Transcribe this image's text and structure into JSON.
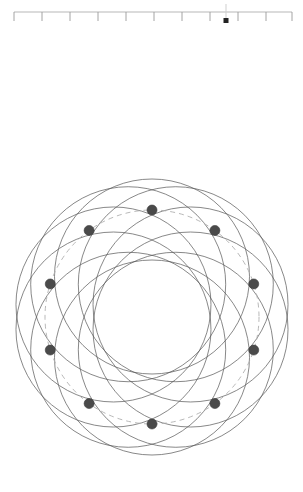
{
  "app": {
    "title": "Spirograph Rosette Viewer",
    "background_color": "#ffffff"
  },
  "ruler": {
    "name": "horizontal-ruler-slider",
    "orientation": "horizontal",
    "x_start": 14,
    "x_end": 292,
    "baseline_y": 12,
    "track_color": "#b8b8b8",
    "tick_color": "#9a9a9a",
    "major_tick_length": 9,
    "major_ticks": [
      14,
      42,
      70,
      98,
      126,
      154,
      182,
      210,
      238,
      266,
      292
    ],
    "tick_labels": [
      "",
      "",
      "",
      "",
      "",
      "",
      "",
      "",
      "",
      "",
      ""
    ],
    "handle": {
      "name": "ruler-handle",
      "position_x": 226,
      "stem_top_y": 4,
      "stem_bottom_y": 18,
      "marker_size": 5,
      "color": "#222222",
      "value_label": ""
    }
  },
  "figure": {
    "name": "rosette-diagram",
    "center_x": 152,
    "center_y": 287,
    "circle_count": 10,
    "circle_radius": 97.5,
    "center_offset_radius": 40.5,
    "stroke_color": "#555555",
    "stroke_width": 0.7,
    "outer_extent_radius": 138,
    "inner_hole_radius": 57,
    "node_ring_radius": 107,
    "node": {
      "name": "vertex-node",
      "count": 10,
      "radius": 5,
      "fill_color": "#4a4a4a",
      "stroke_color": "#3a3a3a"
    },
    "guide_circle": {
      "name": "dashed-guide-circle",
      "radius": 107,
      "style": "dashed",
      "dash_pattern": "5 4",
      "stroke_color": "#b0b0b0",
      "stroke_width": 0.9
    },
    "node_angles_deg": [
      270,
      306,
      342,
      18,
      54,
      90,
      126,
      162,
      198,
      234
    ],
    "nodes": [
      {
        "label": "",
        "x": 152,
        "y": 180
      },
      {
        "label": "",
        "x": 238,
        "y": 242
      },
      {
        "label": "",
        "x": 205,
        "y": 343
      },
      {
        "label": "",
        "x": 99,
        "y": 343
      },
      {
        "label": "",
        "x": 66,
        "y": 242
      },
      {
        "label": "",
        "x": 152,
        "y": 180
      },
      {
        "label": "",
        "x": 238,
        "y": 242
      },
      {
        "label": "",
        "x": 205,
        "y": 343
      },
      {
        "label": "",
        "x": 99,
        "y": 343
      },
      {
        "label": "",
        "x": 66,
        "y": 242
      }
    ]
  }
}
